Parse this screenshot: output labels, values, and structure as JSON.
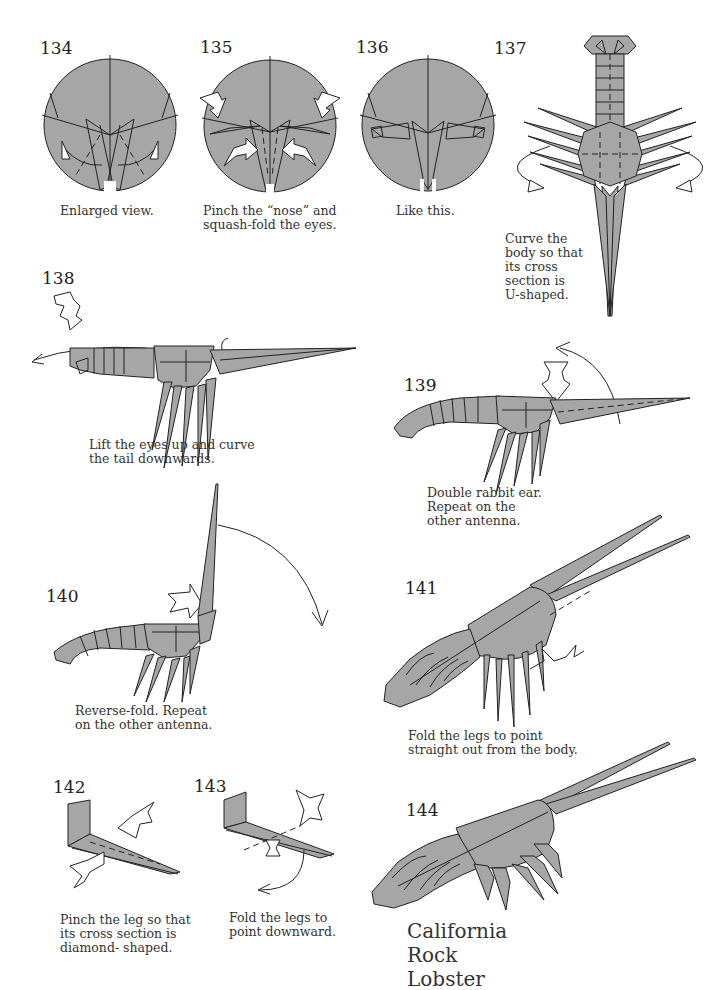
{
  "page": {
    "fill_color": "#a6a6a6",
    "line_color": "#222222"
  },
  "steps": [
    {
      "number": "134",
      "caption": "Enlarged view.",
      "diagram": "enlarged-head-circle"
    },
    {
      "number": "135",
      "caption": "Pinch the “nose” and\nsquash-fold the eyes.",
      "diagram": "pinch-nose-circle"
    },
    {
      "number": "136",
      "caption": "Like this.",
      "diagram": "head-result-circle"
    },
    {
      "number": "137",
      "caption": "Curve the\nbody so that\nits cross\nsection is\nU-shaped.",
      "diagram": "lobster-top-view"
    },
    {
      "number": "138",
      "caption": "Lift the eyes up and curve\nthe tail downwards.",
      "diagram": "lobster-side-flat"
    },
    {
      "number": "139",
      "caption": "Double rabbit ear.\nRepeat on the\nother antenna.",
      "diagram": "lobster-side-curved"
    },
    {
      "number": "140",
      "caption": "Reverse-fold. Repeat\non the other antenna.",
      "diagram": "lobster-antenna-up"
    },
    {
      "number": "141",
      "caption": "Fold the legs to point\nstraight out from the body.",
      "diagram": "lobster-3d-legs-down"
    },
    {
      "number": "142",
      "caption": "Pinch the leg so that\nits cross section is\ndiamond- shaped.",
      "diagram": "leg-pinch"
    },
    {
      "number": "143",
      "caption": "Fold the legs to\npoint downward.",
      "diagram": "leg-fold-down"
    },
    {
      "number": "144",
      "caption": "",
      "diagram": "finished-lobster"
    }
  ],
  "final_title": "California Rock Lobster"
}
